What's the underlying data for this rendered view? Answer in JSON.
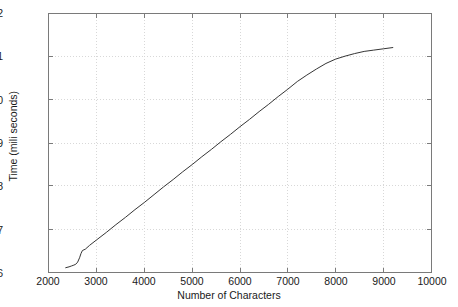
{
  "chart_data": {
    "type": "line",
    "title": "",
    "xlabel": "Number of Characters",
    "ylabel": "Time (mili seconds)",
    "xlim": [
      2000,
      10000
    ],
    "ylim": [
      6,
      12
    ],
    "xticks": [
      2000,
      3000,
      4000,
      5000,
      6000,
      7000,
      8000,
      9000,
      10000
    ],
    "xticklabels": [
      "2000",
      "3000",
      "4000",
      "5000",
      "6000",
      "7000",
      "8000",
      "9000",
      "10000"
    ],
    "yticks": [
      6,
      7,
      8,
      9,
      10,
      11,
      12
    ],
    "yticklabels": [
      "6",
      "7",
      "8",
      "9",
      "10",
      "11",
      "12"
    ],
    "grid": true,
    "grid_style": "dotted",
    "legend": null,
    "series": [
      {
        "name": "encryption time",
        "color": "#333333",
        "line_width": 1,
        "points": [
          [
            2350,
            6.1
          ],
          [
            2420,
            6.12
          ],
          [
            2470,
            6.14
          ],
          [
            2520,
            6.16
          ],
          [
            2560,
            6.18
          ],
          [
            2600,
            6.23
          ],
          [
            2640,
            6.33
          ],
          [
            2670,
            6.43
          ],
          [
            2700,
            6.5
          ],
          [
            2760,
            6.53
          ],
          [
            2850,
            6.62
          ],
          [
            3000,
            6.75
          ],
          [
            3200,
            6.92
          ],
          [
            3400,
            7.1
          ],
          [
            3600,
            7.27
          ],
          [
            3800,
            7.45
          ],
          [
            4000,
            7.62
          ],
          [
            4200,
            7.8
          ],
          [
            4400,
            7.98
          ],
          [
            4600,
            8.15
          ],
          [
            4800,
            8.33
          ],
          [
            5000,
            8.5
          ],
          [
            5200,
            8.68
          ],
          [
            5400,
            8.85
          ],
          [
            5600,
            9.03
          ],
          [
            5800,
            9.2
          ],
          [
            6000,
            9.38
          ],
          [
            6200,
            9.55
          ],
          [
            6400,
            9.73
          ],
          [
            6600,
            9.9
          ],
          [
            6800,
            10.08
          ],
          [
            7000,
            10.25
          ],
          [
            7200,
            10.43
          ],
          [
            7400,
            10.58
          ],
          [
            7600,
            10.72
          ],
          [
            7800,
            10.85
          ],
          [
            8000,
            10.95
          ],
          [
            8200,
            11.02
          ],
          [
            8400,
            11.08
          ],
          [
            8600,
            11.13
          ],
          [
            8800,
            11.16
          ],
          [
            9000,
            11.19
          ],
          [
            9200,
            11.22
          ]
        ]
      }
    ]
  },
  "axes": {
    "frame_color": "#7a7a7a",
    "grid_color": "#d8d8d8",
    "text_color": "#1a1a1a"
  }
}
